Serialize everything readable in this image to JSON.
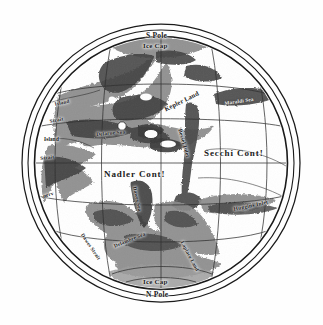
{
  "map": {
    "title": "Map of Mars",
    "projection": "circular-disc",
    "paper_color": "#fefefe",
    "ink_color": "#1a1a1a",
    "sea_color": "#8d8d8d",
    "sea_dark_color": "#4a4a4a",
    "icecap_color": "#a9a9a9",
    "border": {
      "outer_ring": "#1a1a1a",
      "inner_ring": "#1a1a1a",
      "ring_count": 3
    },
    "graticule": {
      "meridians": 5,
      "parallels": 4,
      "line_color": "#2a2a2a"
    }
  },
  "labels": {
    "south_pole": "S Pole",
    "north_pole": "N Pole",
    "ice_cap_top": "Ice  Cap",
    "ice_cap_bottom": "Ice  Cap",
    "secchi_continent": "Secchi  Cont!",
    "madler_continent": "Nadler  Cont!",
    "kepler_land": "Kepler Land",
    "bessel_inlet": "Bessel Inlet",
    "huggins_inlet": "Huggins Inlet",
    "maraldi_sea": "Maraldi Sea",
    "delarue_sea": "Delarue Sea",
    "delambre_sea": "Delambre Sea",
    "dawes_sea": "Dawes Sea",
    "laplace_land": "Laplace Land",
    "island_upper": "Island",
    "island_lower": "Island",
    "strait_upper": "Strait",
    "strait_lower": "Strait",
    "nerv": "nerv",
    "dawes_strait": "Dawes Strait"
  }
}
